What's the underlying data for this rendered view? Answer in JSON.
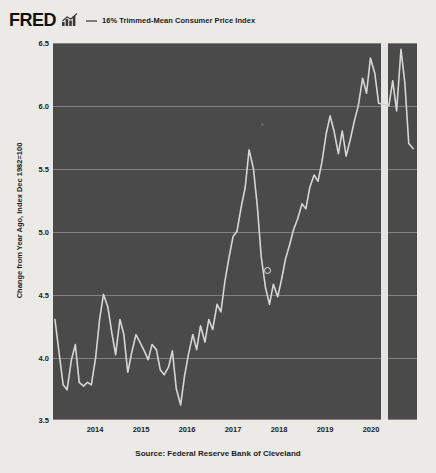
{
  "header": {
    "brand": "FRED",
    "brand_icon": "mini-bar-chart-icon",
    "legend_icon": "legend-line-dash",
    "legend_label": "16% Trimmed-Mean Consumer Price Index"
  },
  "colors": {
    "page_background": "#eceae7",
    "plot_background": "#4a4a4a",
    "gridline": "#8e8e8e",
    "series_line": "#d6d6d6",
    "recession_band": "#e7e5e2",
    "text": "#1c1c1c"
  },
  "footer": {
    "source": "Source: Federal Reserve Bank of Cleveland"
  },
  "cursor": {
    "main_dot_label": "chart-cursor-dot",
    "faint_dot_label": "chart-cursor-dot-secondary"
  },
  "chart_data": {
    "type": "line",
    "title": "16% Trimmed-Mean Consumer Price Index",
    "xlabel": "",
    "ylabel": "Change from Year Ago, Index Dec 1982=100",
    "ylim": [
      3.5,
      6.5
    ],
    "xlim": [
      2013.5,
      2021.0
    ],
    "ytick_values": [
      6.5,
      6.0,
      5.5,
      5.0,
      4.5,
      4.0,
      3.5
    ],
    "ytick_labels": [
      "6.5",
      "6.0",
      "5.5",
      "5.0",
      "4.5",
      "4.0",
      "3.5"
    ],
    "xtick_values": [
      2014,
      2015,
      2016,
      2017,
      2018,
      2019,
      2020
    ],
    "xtick_labels": [
      "2014",
      "2015",
      "2016",
      "2017",
      "2018",
      "2019",
      "2020"
    ],
    "grid": true,
    "legend_position": "top",
    "recession_band": {
      "start": 2020.25,
      "end": 2020.4
    },
    "series": [
      {
        "name": "16% Trimmed-Mean Consumer Price Index",
        "color": "#d6d6d6",
        "x": [
          2013.54,
          2013.62,
          2013.71,
          2013.79,
          2013.88,
          2013.96,
          2014.04,
          2014.13,
          2014.21,
          2014.29,
          2014.38,
          2014.46,
          2014.54,
          2014.63,
          2014.71,
          2014.79,
          2014.88,
          2014.96,
          2015.04,
          2015.13,
          2015.21,
          2015.29,
          2015.38,
          2015.46,
          2015.54,
          2015.63,
          2015.71,
          2015.79,
          2015.88,
          2015.96,
          2016.04,
          2016.13,
          2016.21,
          2016.29,
          2016.38,
          2016.46,
          2016.54,
          2016.63,
          2016.71,
          2016.79,
          2016.88,
          2016.96,
          2017.04,
          2017.13,
          2017.21,
          2017.29,
          2017.38,
          2017.46,
          2017.54,
          2017.63,
          2017.71,
          2017.79,
          2017.88,
          2017.96,
          2018.04,
          2018.13,
          2018.21,
          2018.29,
          2018.38,
          2018.46,
          2018.54,
          2018.63,
          2018.71,
          2018.79,
          2018.88,
          2018.96,
          2019.04,
          2019.13,
          2019.21,
          2019.29,
          2019.38,
          2019.46,
          2019.54,
          2019.63,
          2019.71,
          2019.79,
          2019.88,
          2019.96,
          2020.04,
          2020.13,
          2020.21,
          2020.42,
          2020.5,
          2020.58,
          2020.67,
          2020.75,
          2020.83,
          2020.92
        ],
        "y": [
          4.3,
          4.05,
          3.78,
          3.74,
          3.98,
          4.1,
          3.8,
          3.77,
          3.8,
          3.78,
          4.0,
          4.3,
          4.5,
          4.4,
          4.2,
          4.02,
          4.3,
          4.18,
          3.88,
          4.05,
          4.18,
          4.12,
          4.05,
          3.98,
          4.1,
          4.06,
          3.9,
          3.86,
          3.92,
          4.05,
          3.75,
          3.62,
          3.85,
          4.02,
          4.18,
          4.06,
          4.25,
          4.12,
          4.3,
          4.22,
          4.42,
          4.36,
          4.6,
          4.8,
          4.96,
          5.0,
          5.2,
          5.35,
          5.65,
          5.5,
          5.2,
          4.8,
          4.55,
          4.42,
          4.58,
          4.48,
          4.62,
          4.78,
          4.9,
          5.02,
          5.1,
          5.22,
          5.18,
          5.35,
          5.45,
          5.4,
          5.55,
          5.78,
          5.92,
          5.8,
          5.62,
          5.8,
          5.6,
          5.74,
          5.88,
          6.0,
          6.22,
          6.1,
          6.38,
          6.26,
          6.02,
          6.0,
          6.2,
          5.96,
          6.45,
          6.18,
          5.7,
          5.66
        ]
      }
    ]
  }
}
